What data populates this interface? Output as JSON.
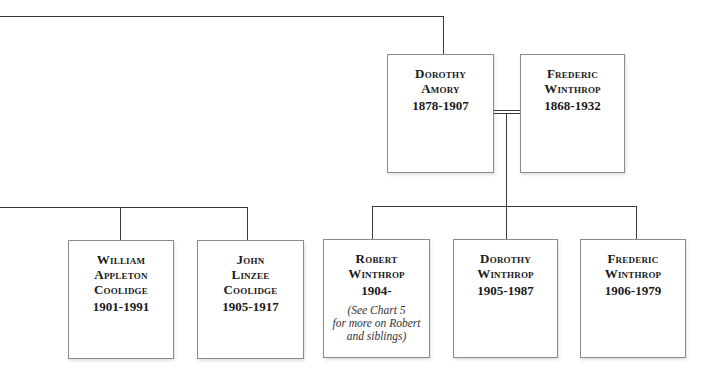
{
  "diagram": {
    "type": "family-tree",
    "parents": [
      {
        "id": "dorothy-amory",
        "name_lines": [
          "Dorothy",
          "Amory"
        ],
        "dates": "1878-1907"
      },
      {
        "id": "frederic-winthrop-sr",
        "name_lines": [
          "Frederic",
          "Winthrop"
        ],
        "dates": "1868-1932"
      }
    ],
    "children_left": [
      {
        "id": "william-appleton-coolidge",
        "name_lines": [
          "William",
          "Appleton",
          "Coolidge"
        ],
        "dates": "1901-1991"
      },
      {
        "id": "john-linzee-coolidge",
        "name_lines": [
          "John",
          "Linzee",
          "Coolidge"
        ],
        "dates": "1905-1917"
      }
    ],
    "children_right": [
      {
        "id": "robert-winthrop",
        "name_lines": [
          "Robert",
          "Winthrop"
        ],
        "dates": "1904-",
        "note_lines": [
          "(See Chart 5",
          "for more on Robert",
          "and siblings)"
        ]
      },
      {
        "id": "dorothy-winthrop",
        "name_lines": [
          "Dorothy",
          "Winthrop"
        ],
        "dates": "1905-1987"
      },
      {
        "id": "frederic-winthrop-jr",
        "name_lines": [
          "Frederic",
          "Winthrop"
        ],
        "dates": "1906-1979"
      }
    ],
    "relationships": [
      {
        "type": "marriage",
        "between": [
          "dorothy-amory",
          "frederic-winthrop-sr"
        ],
        "style": "double-line"
      },
      {
        "type": "parent-of",
        "from": "marriage",
        "to": [
          "robert-winthrop",
          "dorothy-winthrop",
          "frederic-winthrop-jr"
        ]
      },
      {
        "type": "line-continues-offscreen",
        "from": "dorothy-amory",
        "direction": "left"
      },
      {
        "type": "line-continues-offscreen",
        "to": [
          "william-appleton-coolidge",
          "john-linzee-coolidge"
        ],
        "direction": "left"
      }
    ],
    "colors": {
      "line": "#3a3a3a",
      "box_border": "#8a8a8a",
      "text": "#1a1a1a",
      "background": "#ffffff"
    }
  }
}
